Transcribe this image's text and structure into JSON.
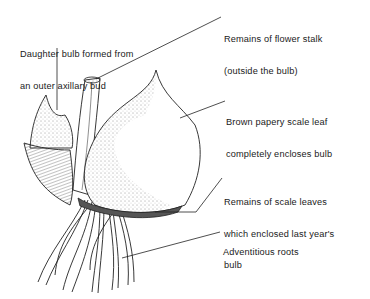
{
  "diagram": {
    "labels": [
      {
        "id": "daughter",
        "lines": [
          "Daughter bulb formed from",
          "an outer axillary bud"
        ]
      },
      {
        "id": "stalk",
        "lines": [
          "Remains of flower stalk",
          "(outside the bulb)"
        ]
      },
      {
        "id": "scale",
        "lines": [
          "Brown papery scale leaf",
          "completely encloses bulb"
        ]
      },
      {
        "id": "remains",
        "lines": [
          "Remains of scale leaves",
          "which enclosed last year's",
          "bulb"
        ]
      },
      {
        "id": "roots",
        "lines": [
          "Adventitious roots"
        ]
      }
    ]
  }
}
